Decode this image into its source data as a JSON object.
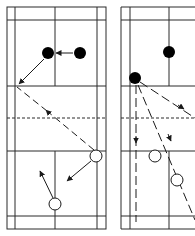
{
  "diagram": {
    "type": "badminton-court-tactics",
    "colors": {
      "line": "#2a2a2a",
      "background": "#ffffff",
      "player_filled": "#000000",
      "player_open": "#ffffff"
    },
    "courts": [
      {
        "id": "left",
        "players_filled": [
          {
            "x": 48,
            "y": 53
          },
          {
            "x": 80,
            "y": 53
          }
        ],
        "players_open": [
          {
            "x": 96,
            "y": 156
          },
          {
            "x": 55,
            "y": 204
          }
        ],
        "moves_solid": [
          {
            "from": [
              73,
              53
            ],
            "to": [
              56,
              53
            ]
          },
          {
            "from": [
              44,
              59
            ],
            "to": [
              19,
              84
            ]
          },
          {
            "from": [
              91,
              161
            ],
            "to": [
              67,
              181
            ]
          },
          {
            "from": [
              53,
              198
            ],
            "to": [
              40,
              171
            ]
          }
        ],
        "shots_dashed": [
          {
            "from": [
              17,
              87
            ],
            "to": [
              94,
              150
            ],
            "arrow_at": [
              47,
              111
            ]
          }
        ]
      },
      {
        "id": "right",
        "players_filled": [
          {
            "x": 169,
            "y": 52
          },
          {
            "x": 135,
            "y": 78
          }
        ],
        "players_open": [
          {
            "x": 155,
            "y": 156
          },
          {
            "x": 177,
            "y": 180
          }
        ],
        "moves_solid": [],
        "shots_dashed": [
          {
            "from": [
              136,
              85
            ],
            "to": [
              136,
              222
            ],
            "arrow_at": [
              136,
              143
            ]
          },
          {
            "from": [
              138,
              85
            ],
            "to": [
              195,
              220
            ],
            "arrow_at": [
              171,
              141
            ]
          },
          {
            "from": [
              140,
              82
            ],
            "to": [
              195,
              118
            ],
            "arrow_at": [
              184,
              109
            ]
          }
        ]
      }
    ]
  }
}
